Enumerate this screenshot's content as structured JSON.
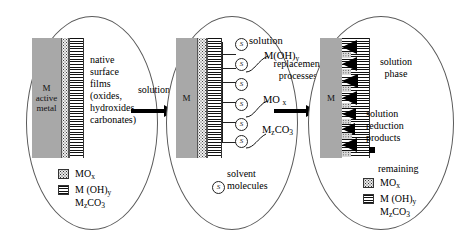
{
  "figure": {
    "background": "#ffffff",
    "metal_color": "#a8a8a8",
    "line_color": "#5a5a5a",
    "product_color": "#000000"
  },
  "stages": [
    {
      "id": "stage-1",
      "metal_label_lines": [
        "M",
        "active",
        "metal"
      ],
      "film_label_lines": [
        "native",
        "surface",
        "films",
        "(oxides,",
        "hydroxides",
        "carbonates)"
      ],
      "legend": [
        {
          "swatch": "mox",
          "text": "MOx",
          "formula_base": "MO",
          "formula_sub": "x"
        },
        {
          "swatch": "hyd",
          "text": "M (OH)y",
          "formula_base": "M (OH)",
          "formula_sub": "y"
        },
        {
          "swatch": "none",
          "text": "MzCO3",
          "formula_base": "M",
          "formula_sub": "z",
          "formula_tail": "CO",
          "formula_tail_sub": "3"
        }
      ]
    },
    {
      "id": "stage-2",
      "metal_label_lines": [
        "M"
      ],
      "solution_label": "solution",
      "callouts": [
        {
          "id": "callout-mohy",
          "base": "M(OH)",
          "sub": "y"
        },
        {
          "id": "callout-mox",
          "base": "MO ",
          "sub": "x"
        },
        {
          "id": "callout-mzco3",
          "base": "M",
          "sub": "z",
          "tail": "CO",
          "tail_sub": "3"
        }
      ],
      "solvent_legend_lines": [
        "solvent",
        "molecules"
      ],
      "solvent_symbol": "S",
      "solvent_count": 6
    },
    {
      "id": "stage-3",
      "metal_label_lines": [
        "M"
      ],
      "phase_label_lines": [
        "solution",
        "phase"
      ],
      "products_label_lines": [
        "solution",
        "reduction",
        "products"
      ],
      "remaining_label": "remaining",
      "legend": [
        {
          "swatch": "mox",
          "text": "MOx",
          "formula_base": "MO",
          "formula_sub": "x"
        },
        {
          "swatch": "hyd",
          "text": "M (OH)y",
          "formula_base": "M (OH)",
          "formula_sub": "y"
        },
        {
          "swatch": "none",
          "text": "MzCO3",
          "formula_base": "M",
          "formula_sub": "z",
          "formula_tail": "CO",
          "formula_tail_sub": "3"
        }
      ]
    }
  ],
  "arrows": [
    {
      "id": "arrow-1",
      "label": "solution"
    },
    {
      "id": "arrow-2",
      "label_line1": "replacement",
      "label_line2": "processes"
    }
  ]
}
